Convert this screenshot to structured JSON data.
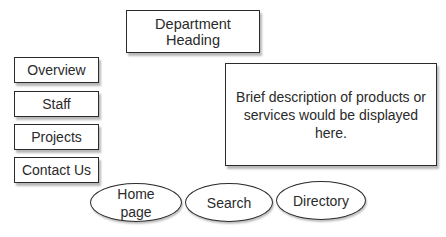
{
  "header": {
    "title": "Department Heading"
  },
  "nav": {
    "items": [
      {
        "label": "Overview"
      },
      {
        "label": "Staff"
      },
      {
        "label": "Projects"
      },
      {
        "label": "Contact Us"
      }
    ]
  },
  "content": {
    "description": "Brief description of products or services would be displayed here."
  },
  "bottom_nav": {
    "items": [
      {
        "label": "Home page"
      },
      {
        "label": "Search"
      },
      {
        "label": "Directory"
      }
    ]
  }
}
